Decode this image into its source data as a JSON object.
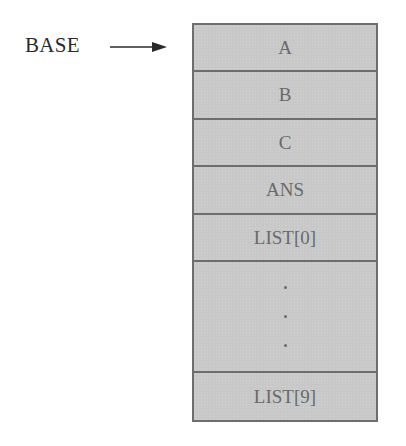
{
  "diagram": {
    "pointer_label": "BASE",
    "pointer_target_index": 0,
    "cells": [
      {
        "label": "A"
      },
      {
        "label": "B"
      },
      {
        "label": "C"
      },
      {
        "label": "ANS"
      },
      {
        "label": "LIST[0]"
      },
      {
        "label": "",
        "ellipsis": "vertical-dots"
      },
      {
        "label": "LIST[9]"
      }
    ],
    "colors": {
      "cell_fill": "#c8c8c8",
      "border": "#6e6e6e",
      "cell_text": "#6a6a6a",
      "label_text": "#2a2a2a"
    }
  }
}
